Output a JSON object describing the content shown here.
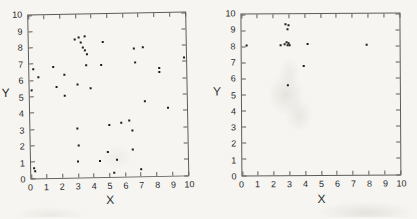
{
  "page": {
    "background_color": "#f6f5f1"
  },
  "style": {
    "marker_color": "#1b1b1b",
    "marker_size_px": 2,
    "axis_color": "#5c5c5c"
  },
  "chart_data": [
    {
      "type": "scatter",
      "title": "",
      "xlabel": "X",
      "ylabel": "Y",
      "xlim": [
        0,
        10
      ],
      "ylim": [
        0,
        10
      ],
      "xticks": [
        0,
        1,
        2,
        3,
        4,
        5,
        6,
        7,
        8,
        9,
        10
      ],
      "yticks": [
        0,
        1,
        2,
        3,
        4,
        5,
        6,
        7,
        8,
        9,
        10
      ],
      "grid": false,
      "legend": null,
      "points": [
        [
          0.1,
          5.4
        ],
        [
          0.2,
          0.6
        ],
        [
          0.25,
          0.4
        ],
        [
          0.25,
          6.7
        ],
        [
          0.55,
          6.2
        ],
        [
          1.55,
          6.8
        ],
        [
          1.7,
          5.6
        ],
        [
          2.2,
          6.3
        ],
        [
          2.2,
          5.05
        ],
        [
          2.9,
          8.45
        ],
        [
          3.2,
          8.6
        ],
        [
          3.3,
          8.3
        ],
        [
          3.55,
          8.65
        ],
        [
          3.45,
          8.0
        ],
        [
          3.55,
          7.8
        ],
        [
          3.7,
          7.55
        ],
        [
          3.6,
          6.9
        ],
        [
          3.05,
          5.7
        ],
        [
          3.0,
          3.0
        ],
        [
          3.05,
          1.95
        ],
        [
          3.0,
          1.0
        ],
        [
          3.9,
          5.45
        ],
        [
          4.7,
          8.3
        ],
        [
          4.6,
          6.85
        ],
        [
          4.4,
          1.0
        ],
        [
          4.9,
          1.55
        ],
        [
          5.0,
          3.2
        ],
        [
          5.3,
          0.25
        ],
        [
          5.5,
          1.05
        ],
        [
          5.8,
          3.3
        ],
        [
          6.3,
          3.45
        ],
        [
          6.5,
          2.85
        ],
        [
          6.5,
          1.65
        ],
        [
          6.7,
          7.85
        ],
        [
          7.25,
          7.9
        ],
        [
          6.75,
          7.0
        ],
        [
          7.0,
          0.4
        ],
        [
          7.3,
          4.6
        ],
        [
          8.3,
          6.6
        ],
        [
          8.3,
          6.4
        ],
        [
          8.8,
          4.2
        ],
        [
          9.9,
          7.25
        ]
      ]
    },
    {
      "type": "scatter",
      "title": "",
      "xlabel": "X",
      "ylabel": "Y",
      "xlim": [
        0,
        10
      ],
      "ylim": [
        0,
        10
      ],
      "xticks": [
        0,
        1,
        2,
        3,
        4,
        5,
        6,
        7,
        8,
        9,
        10
      ],
      "yticks": [
        0,
        1,
        2,
        3,
        4,
        5,
        6,
        7,
        8,
        9,
        10
      ],
      "grid": false,
      "legend": null,
      "points": [
        [
          0.3,
          8.05
        ],
        [
          2.8,
          9.4
        ],
        [
          2.95,
          9.3
        ],
        [
          2.9,
          9.05
        ],
        [
          2.45,
          8.1
        ],
        [
          2.75,
          8.15
        ],
        [
          2.85,
          8.25
        ],
        [
          2.9,
          8.1
        ],
        [
          3.0,
          8.2
        ],
        [
          3.05,
          8.1
        ],
        [
          4.2,
          8.15
        ],
        [
          7.9,
          8.1
        ],
        [
          3.9,
          6.8
        ],
        [
          2.9,
          5.6
        ]
      ]
    }
  ]
}
